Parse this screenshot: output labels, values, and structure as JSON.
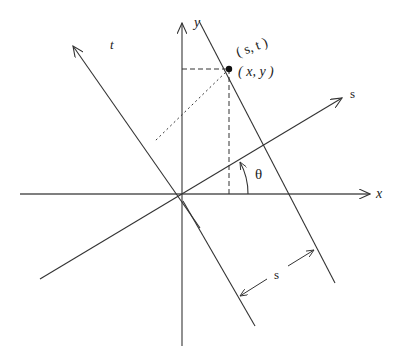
{
  "diagram": {
    "labels": {
      "x_axis": "x",
      "y_axis": "y",
      "s_axis": "s",
      "t_axis": "t",
      "point_st": "( s, t )",
      "point_xy": "( x, y )",
      "angle": "θ",
      "distance": "s"
    },
    "colors": {
      "line": "#333333",
      "background": "#ffffff"
    }
  }
}
